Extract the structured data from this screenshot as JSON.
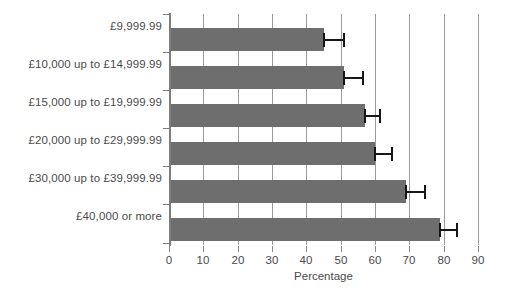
{
  "chart_data": {
    "type": "bar",
    "orientation": "horizontal",
    "title": "",
    "xlabel": "Percentage",
    "ylabel": "",
    "xlim": [
      0,
      90
    ],
    "xticks": [
      0,
      10,
      20,
      30,
      40,
      50,
      60,
      70,
      80,
      90
    ],
    "xtick_labels": [
      "0",
      "10",
      "20",
      "30",
      "40",
      "50",
      "60",
      "70",
      "80",
      "90"
    ],
    "grid": "vertical",
    "legend": "none",
    "bar_color": "#6e6e6e",
    "error_color": "#161616",
    "categories": [
      "£9,999.99",
      "£10,000 up to £14,999.99",
      "£15,000 up to £19,999.99",
      "£20,000 up to £29,999.99",
      "£30,000 up to £39,999.99",
      "£40,000 or more"
    ],
    "values": [
      45,
      51,
      57,
      60,
      69,
      79
    ],
    "error_low": [
      45,
      51,
      57,
      60,
      69,
      79
    ],
    "error_high": [
      51,
      56.5,
      61.5,
      65,
      74.5,
      84
    ]
  }
}
